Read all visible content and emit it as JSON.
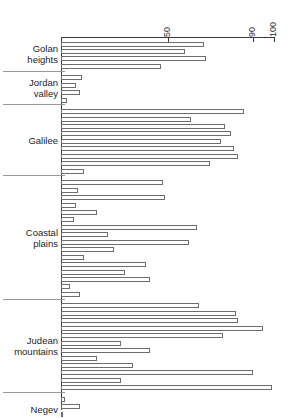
{
  "chart_data": {
    "type": "bar",
    "orientation": "horizontal",
    "title": "",
    "xlabel": "",
    "ylabel": "",
    "xlim": [
      0,
      100
    ],
    "grid": false,
    "legend": null,
    "axis_ticks": [
      {
        "value": 50,
        "label": "50"
      },
      {
        "value": 90,
        "label": "90"
      },
      {
        "value": 100,
        "label": "100"
      }
    ],
    "groups": [
      {
        "name": "Golan heights",
        "label": "Golan\nheights",
        "values": [
          67,
          58,
          68,
          47
        ]
      },
      {
        "name": "Jordan valley",
        "label": "Jordan\nvalley",
        "values": [
          10,
          7,
          9,
          3
        ]
      },
      {
        "name": "Galilee",
        "label": "Galilee",
        "values": [
          86,
          61,
          77,
          80,
          75,
          81,
          83,
          70,
          11
        ]
      },
      {
        "name": "Coastal plains",
        "label": "Coastal\nplains",
        "values": [
          48,
          8,
          49,
          7,
          17,
          6,
          64,
          22,
          60,
          25,
          11,
          40,
          30,
          42,
          4,
          9
        ]
      },
      {
        "name": "Judean mountains",
        "label": "Judean\nmountains",
        "values": [
          65,
          82,
          83,
          95,
          76,
          28,
          42,
          17,
          34,
          90,
          28,
          99
        ]
      },
      {
        "name": "Negev",
        "label": "Negev",
        "values": [
          2,
          9,
          1,
          4
        ]
      }
    ]
  }
}
